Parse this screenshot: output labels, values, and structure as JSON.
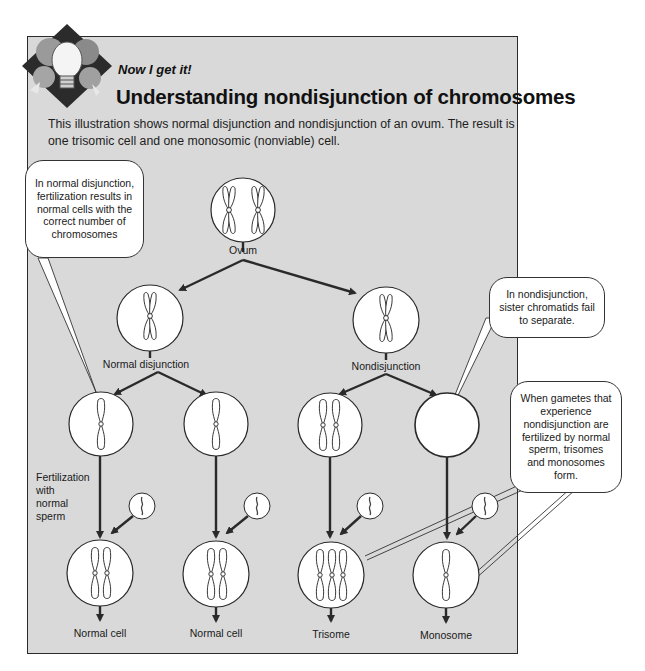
{
  "header": {
    "logo_icon": "lightbulb-gears-icon",
    "kicker": "Now I get it!",
    "title": "Understanding nondisjunction of chromosomes",
    "intro": "This illustration shows normal disjunction and nondisjunction of an ovum. The result is one trisomic cell and one monosomic (nonviable) cell."
  },
  "diagram": {
    "root_label": "Ovum",
    "branch_labels": {
      "normal": "Normal disjunction",
      "nondisjunction": "Nondisjunction"
    },
    "fertilization_label": [
      "Fertilization",
      "with",
      "normal",
      "sperm"
    ],
    "results": [
      {
        "label": "Normal cell",
        "chromosomes": 2
      },
      {
        "label": "Normal cell",
        "chromosomes": 2
      },
      {
        "label": "Trisome",
        "chromosomes": 3
      },
      {
        "label": "Monosome",
        "chromosomes": 1
      }
    ],
    "gametes": [
      {
        "chromosomes": 1
      },
      {
        "chromosomes": 1
      },
      {
        "chromosomes": 2
      },
      {
        "chromosomes": 0
      }
    ]
  },
  "callouts": {
    "normal": "In normal disjunction, fertilization results in normal cells with the correct number of chromosomes",
    "nondisjunction": "In nondisjunction, sister chromatids fail to separate.",
    "gametes": "When gametes that experience nondisjunction are fertilized by normal sperm, trisomes and monosomes form."
  },
  "colors": {
    "panel_bg": "#d9d9d9",
    "line": "#2a2a2a",
    "cell_fill": "#ffffff"
  }
}
